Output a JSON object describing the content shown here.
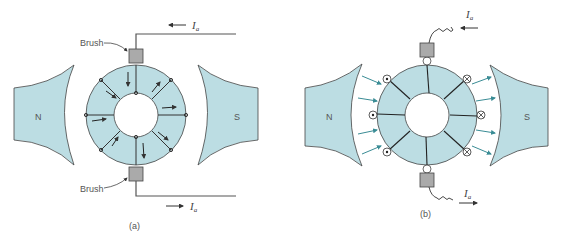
{
  "colors": {
    "iron": "#bcdde3",
    "outline": "#444444",
    "brush": "#aaaaaa",
    "flux_arrow": "#3a8c95",
    "wire": "#555555",
    "text": "#555555"
  },
  "panel_a": {
    "caption": "(a)",
    "pole_north": "N",
    "pole_south": "S",
    "brush_top_label": "Brush",
    "brush_bottom_label": "Brush",
    "current_top": "I",
    "current_top_sub": "a",
    "current_bottom": "I",
    "current_bottom_sub": "a",
    "description": "Ring (Gramme) armature with coil windings; arrows show current direction in coils"
  },
  "panel_b": {
    "caption": "(b)",
    "pole_north": "N",
    "pole_south": "S",
    "current_top": "I",
    "current_top_sub": "a",
    "current_bottom": "I",
    "current_bottom_sub": "a",
    "left_conductors": "dot (out of page)",
    "right_conductors": "cross (into page)",
    "description": "Ring armature with conductors, flux arrows from N to S, brushes with coiled leads"
  }
}
